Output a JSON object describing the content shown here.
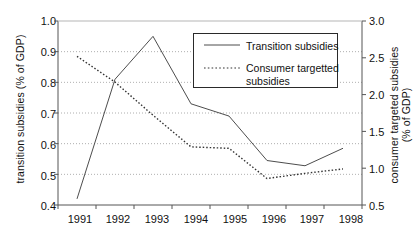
{
  "chart_data": {
    "type": "line",
    "title": "",
    "xlabel": "",
    "categories": [
      "1991",
      "1992",
      "1993",
      "1994",
      "1995",
      "1996",
      "1997",
      "1998"
    ],
    "grid": true,
    "legend_position": "top-right",
    "series": [
      {
        "name": "Transition subsidies",
        "axis": "left",
        "style": "solid",
        "color": "#4d4d4d",
        "values": [
          0.42,
          0.81,
          0.95,
          0.73,
          0.69,
          0.545,
          0.528,
          0.585
        ]
      },
      {
        "name": "Consumer targetted subsidies",
        "axis": "right",
        "style": "dotted",
        "color": "#333333",
        "values": [
          2.52,
          2.17,
          1.72,
          1.29,
          1.27,
          0.86,
          0.93,
          0.99
        ]
      }
    ],
    "left_axis": {
      "label": "transition subsidies (% of GDP)",
      "ylim": [
        0.4,
        1.0
      ],
      "ticks": [
        "0.4",
        "0.5",
        "0.6",
        "0.7",
        "0.8",
        "0.9",
        "1.0"
      ],
      "tick_values": [
        0.4,
        0.5,
        0.6,
        0.7,
        0.8,
        0.9,
        1.0
      ]
    },
    "right_axis": {
      "label_line1": "consumer targeted subsidies",
      "label_line2": "(% of GDP)",
      "ylim": [
        0.5,
        3.0
      ],
      "ticks": [
        "0.5",
        "1.0",
        "1.5",
        "2.0",
        "2.5",
        "3.0"
      ],
      "tick_values": [
        0.5,
        1.0,
        1.5,
        2.0,
        2.5,
        3.0
      ]
    },
    "legend": {
      "entry_1": "Transition subsidies",
      "entry_2_line1": "Consumer targetted",
      "entry_2_line2": "subsidies"
    }
  }
}
